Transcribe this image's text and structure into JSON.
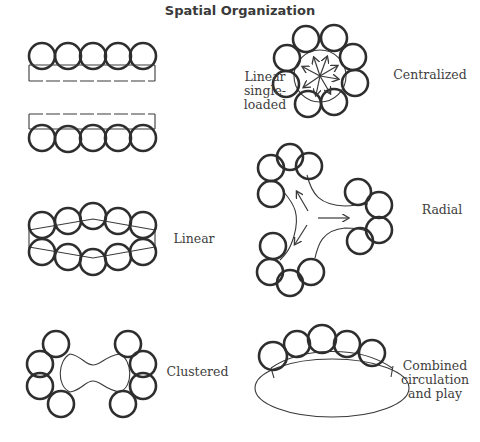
{
  "title": "Spatial Organization",
  "diagrams": [
    {
      "id": "linear-single-loaded",
      "label": "Linear\nsingle-\nloaded"
    },
    {
      "id": "centralized",
      "label": "Centralized"
    },
    {
      "id": "linear",
      "label": "Linear"
    },
    {
      "id": "radial",
      "label": "Radial"
    },
    {
      "id": "clustered",
      "label": "Clustered"
    },
    {
      "id": "combined",
      "label": "Combined\ncirculation\nand play"
    }
  ],
  "colors": {
    "ink": "#2e2e2e",
    "text": "#404040",
    "background": "#ffffff"
  }
}
